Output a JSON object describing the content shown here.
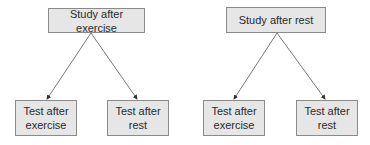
{
  "diagram": {
    "type": "tree",
    "groups": [
      {
        "root": {
          "label": "Study after exercise"
        },
        "children": [
          {
            "label": "Test after exercise",
            "line1": "Test after",
            "line2": "exercise"
          },
          {
            "label": "Test after rest",
            "line1": "Test after",
            "line2": "rest"
          }
        ]
      },
      {
        "root": {
          "label": "Study after rest"
        },
        "children": [
          {
            "label": "Test after exercise",
            "line1": "Test after",
            "line2": "exercise"
          },
          {
            "label": "Test after rest",
            "line1": "Test after",
            "line2": "rest"
          }
        ]
      }
    ],
    "colors": {
      "box_fill": "#e6e6e6",
      "box_border": "#8a8a8a",
      "arrow": "#555555"
    }
  }
}
